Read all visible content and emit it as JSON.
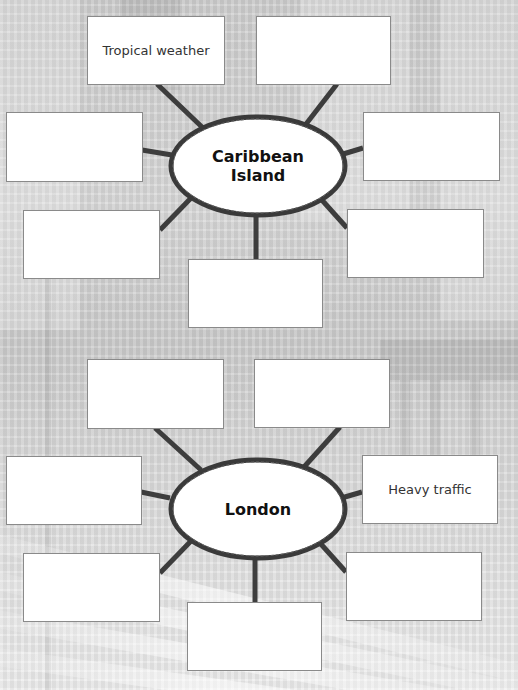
{
  "diagrams": [
    {
      "center_label": "Caribbean\nIsland",
      "boxes": [
        {
          "position": "top-left",
          "text": "Tropical weather"
        },
        {
          "position": "top-right",
          "text": ""
        },
        {
          "position": "left",
          "text": ""
        },
        {
          "position": "right",
          "text": ""
        },
        {
          "position": "bottom-left",
          "text": ""
        },
        {
          "position": "bottom",
          "text": ""
        },
        {
          "position": "bottom-right",
          "text": ""
        }
      ]
    },
    {
      "center_label": "London",
      "boxes": [
        {
          "position": "top-left",
          "text": ""
        },
        {
          "position": "top-right",
          "text": ""
        },
        {
          "position": "left",
          "text": ""
        },
        {
          "position": "right",
          "text": "Heavy traffic"
        },
        {
          "position": "bottom-left",
          "text": ""
        },
        {
          "position": "bottom",
          "text": ""
        },
        {
          "position": "bottom-right",
          "text": ""
        }
      ]
    }
  ],
  "colors": {
    "connector": "#3d3d3d",
    "box_border": "#8a8a8a",
    "box_fill": "#ffffff",
    "hub_outline": "#3a3a3a"
  }
}
